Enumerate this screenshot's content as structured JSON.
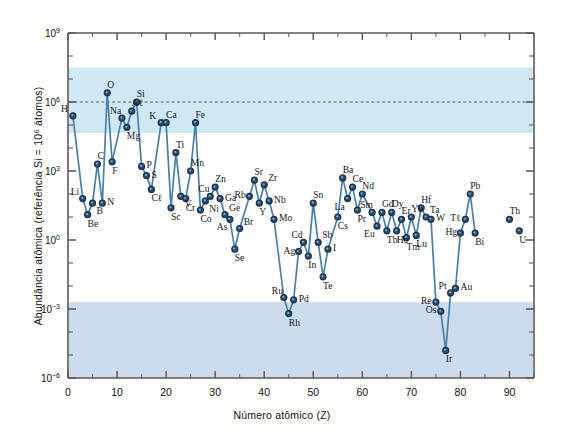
{
  "figure": {
    "background_color": "#fdfdfc",
    "plot_background_color": "#ffffff",
    "band_color": "#cfe8f3",
    "band_color_lower": "#ccdced",
    "line_color": "#4a7fa8",
    "marker_fill": "#2c4f6e",
    "marker_ring": "#1b3350",
    "axis_color": "#5a5a5a"
  },
  "axes": {
    "x": {
      "label": "Número atômico (Z)",
      "ticks": [
        0,
        10,
        20,
        30,
        40,
        50,
        60,
        70,
        80,
        90
      ],
      "tick_labels": [
        "0",
        "10",
        "20",
        "30",
        "40",
        "50",
        "60",
        "70",
        "80",
        "90"
      ],
      "min": 0,
      "max": 95
    },
    "y": {
      "label": "Abundância atômica (referência Si = 10⁶ átomos)",
      "tick_labels": [
        "10⁹",
        "10⁶",
        "10³",
        "10⁰",
        "10⁻³",
        "10⁻⁶"
      ],
      "tick_exponents": [
        9,
        6,
        3,
        0,
        -3,
        -6
      ],
      "min_exponent": -6,
      "max_exponent": 9,
      "scale": "log"
    }
  },
  "annotations": {
    "reference_line": {
      "name": "si-reference-line",
      "y_exponent": 6,
      "style": "dashed"
    },
    "bands": [
      {
        "name": "upper-abundance-band",
        "from_exponent": 4.65,
        "to_exponent": 7.5
      },
      {
        "name": "lower-abundance-band",
        "from_exponent": -6,
        "to_exponent": -2.7
      }
    ]
  },
  "chart_data": {
    "type": "line",
    "title": "",
    "xlabel": "Número atômico (Z)",
    "ylabel": "Abundância atômica (referência Si = 10⁶ átomos)",
    "xlim": [
      0,
      95
    ],
    "ylim_exponent": [
      -6,
      9
    ],
    "yscale": "log",
    "grid": false,
    "legend": "none",
    "series": [
      {
        "name": "Abundância relativa dos elementos",
        "connected": true,
        "points": [
          {
            "symbol": "H",
            "z": 1,
            "log_abundance": 5.4,
            "label_pos": "above-left"
          },
          {
            "symbol": "Li",
            "z": 3,
            "log_abundance": 1.8,
            "label_pos": "above-left"
          },
          {
            "symbol": "Be",
            "z": 4,
            "log_abundance": 1.1,
            "label_pos": "below"
          },
          {
            "symbol": "B",
            "z": 5,
            "log_abundance": 1.6,
            "label_pos": "below-right"
          },
          {
            "symbol": "C",
            "z": 6,
            "log_abundance": 3.3,
            "label_pos": "above"
          },
          {
            "symbol": "N",
            "z": 7,
            "log_abundance": 1.6,
            "label_pos": "right"
          },
          {
            "symbol": "O",
            "z": 8,
            "log_abundance": 6.4,
            "label_pos": "above"
          },
          {
            "symbol": "F",
            "z": 9,
            "log_abundance": 3.4,
            "label_pos": "below"
          },
          {
            "symbol": "Na",
            "z": 11,
            "log_abundance": 5.3,
            "label_pos": "above-left"
          },
          {
            "symbol": "Mg",
            "z": 12,
            "log_abundance": 4.9,
            "label_pos": "below"
          },
          {
            "symbol": "Aℓ",
            "z": 13,
            "log_abundance": 5.6,
            "label_pos": "above"
          },
          {
            "symbol": "Si",
            "z": 14,
            "log_abundance": 6.0,
            "label_pos": "above"
          },
          {
            "symbol": "P",
            "z": 15,
            "log_abundance": 3.2,
            "label_pos": "right"
          },
          {
            "symbol": "S",
            "z": 16,
            "log_abundance": 2.8,
            "label_pos": "right"
          },
          {
            "symbol": "Cℓ",
            "z": 17,
            "log_abundance": 2.2,
            "label_pos": "below"
          },
          {
            "symbol": "K",
            "z": 19,
            "log_abundance": 5.1,
            "label_pos": "above-left"
          },
          {
            "symbol": "Ca",
            "z": 20,
            "log_abundance": 5.1,
            "label_pos": "above"
          },
          {
            "symbol": "Sc",
            "z": 21,
            "log_abundance": 1.4,
            "label_pos": "below"
          },
          {
            "symbol": "Ti",
            "z": 22,
            "log_abundance": 3.8,
            "label_pos": "above"
          },
          {
            "symbol": "V",
            "z": 23,
            "log_abundance": 1.9,
            "label_pos": "below-right"
          },
          {
            "symbol": "Cr",
            "z": 24,
            "log_abundance": 1.8,
            "label_pos": "below"
          },
          {
            "symbol": "Mn",
            "z": 25,
            "log_abundance": 3.0,
            "label_pos": "above"
          },
          {
            "symbol": "Fe",
            "z": 26,
            "log_abundance": 5.1,
            "label_pos": "above"
          },
          {
            "symbol": "Co",
            "z": 27,
            "log_abundance": 1.3,
            "label_pos": "below"
          },
          {
            "symbol": "Ni",
            "z": 28,
            "log_abundance": 1.7,
            "label_pos": "below-right"
          },
          {
            "symbol": "Cu",
            "z": 29,
            "log_abundance": 1.9,
            "label_pos": "above-left"
          },
          {
            "symbol": "Zn",
            "z": 30,
            "log_abundance": 2.3,
            "label_pos": "above"
          },
          {
            "symbol": "Ga",
            "z": 31,
            "log_abundance": 1.8,
            "label_pos": "right"
          },
          {
            "symbol": "Ge",
            "z": 32,
            "log_abundance": 1.1,
            "label_pos": "above-right"
          },
          {
            "symbol": "As",
            "z": 33,
            "log_abundance": 0.9,
            "label_pos": "below-left"
          },
          {
            "symbol": "Se",
            "z": 34,
            "log_abundance": -0.4,
            "label_pos": "below"
          },
          {
            "symbol": "Br",
            "z": 35,
            "log_abundance": 0.5,
            "label_pos": "above-right"
          },
          {
            "symbol": "Rb",
            "z": 37,
            "log_abundance": 1.9,
            "label_pos": "left"
          },
          {
            "symbol": "Sr",
            "z": 38,
            "log_abundance": 2.6,
            "label_pos": "above"
          },
          {
            "symbol": "Y",
            "z": 39,
            "log_abundance": 1.6,
            "label_pos": "below"
          },
          {
            "symbol": "Zr",
            "z": 40,
            "log_abundance": 2.4,
            "label_pos": "above-right"
          },
          {
            "symbol": "Nb",
            "z": 41,
            "log_abundance": 1.7,
            "label_pos": "right"
          },
          {
            "symbol": "Mo",
            "z": 42,
            "log_abundance": 0.9,
            "label_pos": "right"
          },
          {
            "symbol": "Ru",
            "z": 44,
            "log_abundance": -2.5,
            "label_pos": "above-left"
          },
          {
            "symbol": "Rh",
            "z": 45,
            "log_abundance": -3.2,
            "label_pos": "below"
          },
          {
            "symbol": "Pd",
            "z": 46,
            "log_abundance": -2.6,
            "label_pos": "right"
          },
          {
            "symbol": "Ag",
            "z": 47,
            "log_abundance": -0.5,
            "label_pos": "left"
          },
          {
            "symbol": "Cd",
            "z": 48,
            "log_abundance": -0.1,
            "label_pos": "above-left"
          },
          {
            "symbol": "In",
            "z": 49,
            "log_abundance": -0.7,
            "label_pos": "below"
          },
          {
            "symbol": "Sn",
            "z": 50,
            "log_abundance": 1.6,
            "label_pos": "above"
          },
          {
            "symbol": "Sb",
            "z": 51,
            "log_abundance": -0.1,
            "label_pos": "above-right"
          },
          {
            "symbol": "Te",
            "z": 52,
            "log_abundance": -1.6,
            "label_pos": "below"
          },
          {
            "symbol": "I",
            "z": 53,
            "log_abundance": -0.4,
            "label_pos": "right"
          },
          {
            "symbol": "Cs",
            "z": 55,
            "log_abundance": 1.0,
            "label_pos": "below"
          },
          {
            "symbol": "Ba",
            "z": 56,
            "log_abundance": 2.7,
            "label_pos": "above"
          },
          {
            "symbol": "La",
            "z": 57,
            "log_abundance": 1.8,
            "label_pos": "below-left"
          },
          {
            "symbol": "Ce",
            "z": 58,
            "log_abundance": 2.3,
            "label_pos": "above"
          },
          {
            "symbol": "Pr",
            "z": 59,
            "log_abundance": 1.3,
            "label_pos": "below"
          },
          {
            "symbol": "Nd",
            "z": 60,
            "log_abundance": 2.0,
            "label_pos": "above"
          },
          {
            "symbol": "Sm",
            "z": 62,
            "log_abundance": 1.2,
            "label_pos": "above-left"
          },
          {
            "symbol": "Eu",
            "z": 63,
            "log_abundance": 0.6,
            "label_pos": "below-left"
          },
          {
            "symbol": "Gd",
            "z": 64,
            "log_abundance": 1.2,
            "label_pos": "above"
          },
          {
            "symbol": "Tb",
            "z": 65,
            "log_abundance": 0.4,
            "label_pos": "below"
          },
          {
            "symbol": "Dy",
            "z": 66,
            "log_abundance": 1.2,
            "label_pos": "above"
          },
          {
            "symbol": "Ho",
            "z": 67,
            "log_abundance": 0.4,
            "label_pos": "below"
          },
          {
            "symbol": "Er",
            "z": 68,
            "log_abundance": 0.9,
            "label_pos": "above"
          },
          {
            "symbol": "Tm",
            "z": 69,
            "log_abundance": 0.1,
            "label_pos": "below"
          },
          {
            "symbol": "Yb",
            "z": 70,
            "log_abundance": 1.0,
            "label_pos": "above"
          },
          {
            "symbol": "Lu",
            "z": 71,
            "log_abundance": 0.2,
            "label_pos": "below"
          },
          {
            "symbol": "Hf",
            "z": 72,
            "log_abundance": 1.4,
            "label_pos": "above"
          },
          {
            "symbol": "Ta",
            "z": 73,
            "log_abundance": 1.0,
            "label_pos": "above-right"
          },
          {
            "symbol": "W",
            "z": 74,
            "log_abundance": 0.9,
            "label_pos": "right"
          },
          {
            "symbol": "Re",
            "z": 75,
            "log_abundance": -2.7,
            "label_pos": "left"
          },
          {
            "symbol": "Os",
            "z": 76,
            "log_abundance": -3.1,
            "label_pos": "left"
          },
          {
            "symbol": "Ir",
            "z": 77,
            "log_abundance": -4.8,
            "label_pos": "below"
          },
          {
            "symbol": "Pt",
            "z": 78,
            "log_abundance": -2.3,
            "label_pos": "above-left"
          },
          {
            "symbol": "Au",
            "z": 79,
            "log_abundance": -2.1,
            "label_pos": "right"
          },
          {
            "symbol": "Hg",
            "z": 80,
            "log_abundance": 0.3,
            "label_pos": "left"
          },
          {
            "symbol": "Tℓ",
            "z": 81,
            "log_abundance": 0.9,
            "label_pos": "left"
          },
          {
            "symbol": "Pb",
            "z": 82,
            "log_abundance": 2.0,
            "label_pos": "above"
          },
          {
            "symbol": "Bi",
            "z": 83,
            "log_abundance": 0.3,
            "label_pos": "below"
          }
        ]
      },
      {
        "name": "Actinídeos isolados",
        "connected": false,
        "points": [
          {
            "symbol": "Th",
            "z": 90,
            "log_abundance": 0.9,
            "label_pos": "above"
          },
          {
            "symbol": "U",
            "z": 92,
            "log_abundance": 0.4,
            "label_pos": "below"
          }
        ]
      }
    ]
  }
}
